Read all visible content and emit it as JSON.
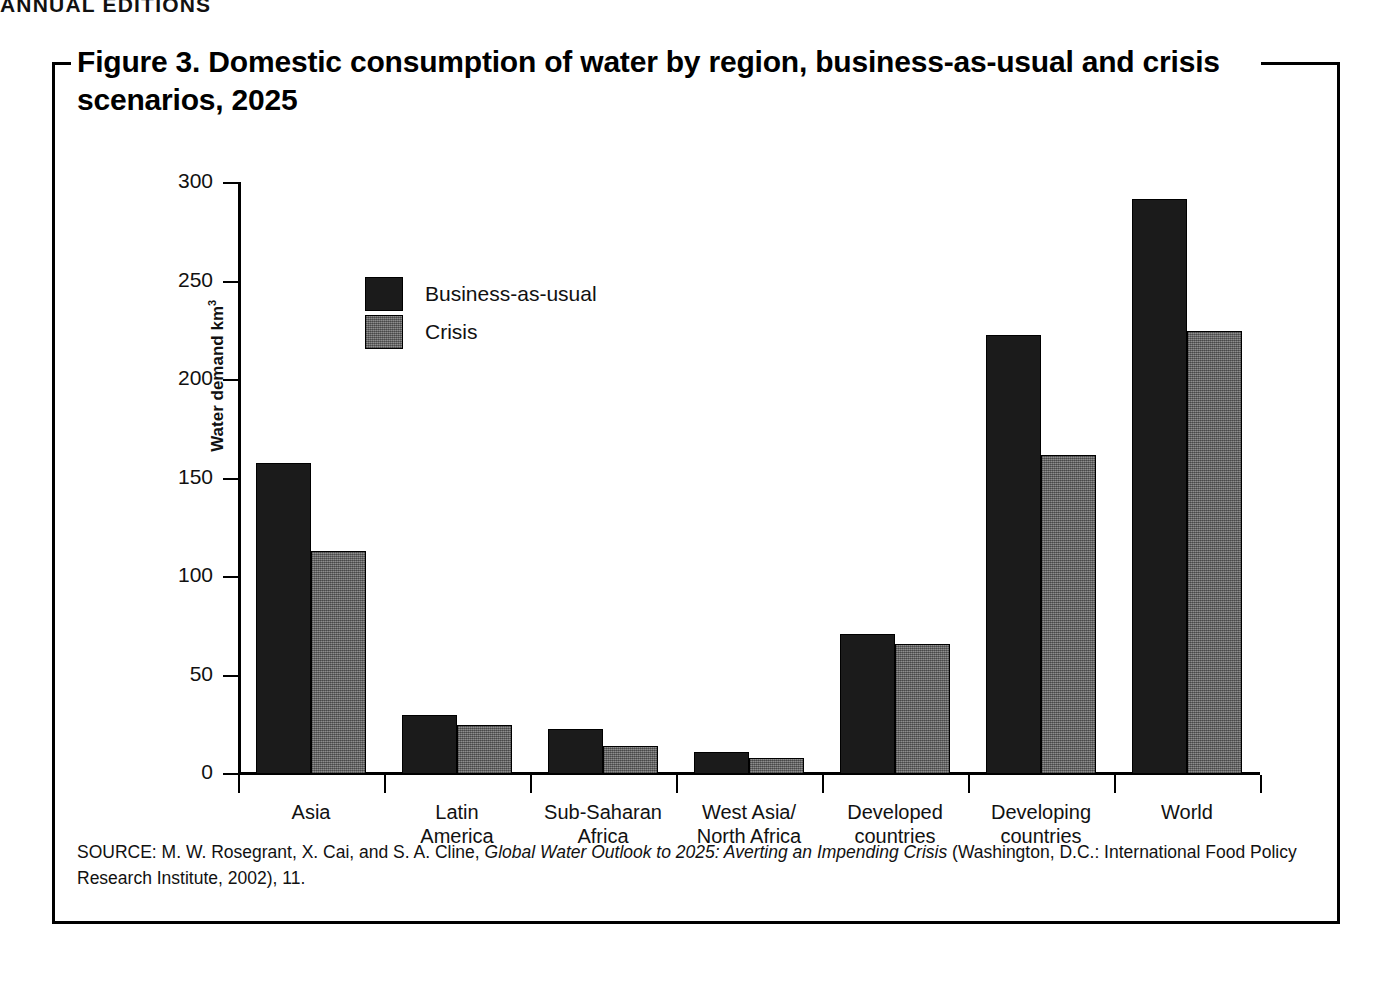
{
  "running_head": "ANNUAL EDITIONS",
  "figure": {
    "title": "Figure 3. Domestic consumption of water by region, business-as-usual and crisis scenarios, 2025",
    "source_prefix": "SOURCE: M. W. Rosegrant, X. Cai, and S. A. Cline, ",
    "source_italic": "Global Water Outlook to 2025: Averting an Impending Crisis",
    "source_suffix": " (Washington, D.C.: International Food Policy Research Institute, 2002), 11."
  },
  "colors": {
    "business_as_usual": "#1b1b1b",
    "crisis": "#767676",
    "axis": "#000000",
    "frame": "#000000",
    "background": "#ffffff"
  },
  "legend": {
    "position": "inside-upper-left",
    "items": [
      {
        "label": "Business-as-usual",
        "swatch": "business_as_usual"
      },
      {
        "label": "Crisis",
        "swatch": "crisis"
      }
    ]
  },
  "chart_data": {
    "type": "bar",
    "title": "Figure 3. Domestic consumption of water by region, business-as-usual and crisis scenarios, 2025",
    "xlabel": "",
    "ylabel": "Water demand km³",
    "ylim": [
      0,
      300
    ],
    "yticks": [
      0,
      50,
      100,
      150,
      200,
      250,
      300
    ],
    "ytick_labels": [
      "0",
      "50",
      "100",
      "150",
      "200",
      "250",
      "300"
    ],
    "grid": false,
    "legend_position": "upper left (inside plot)",
    "categories": [
      "Asia",
      "Latin America",
      "Sub-Saharan Africa",
      "West Asia/North Africa",
      "Developed countries",
      "Developing countries",
      "World"
    ],
    "category_lines": [
      [
        "Asia"
      ],
      [
        "Latin",
        "America"
      ],
      [
        "Sub-Saharan",
        "Africa"
      ],
      [
        "West Asia/",
        "North Africa"
      ],
      [
        "Developed",
        "countries"
      ],
      [
        "Developing",
        "countries"
      ],
      [
        "World"
      ]
    ],
    "series": [
      {
        "name": "Business-as-usual",
        "color": "#1b1b1b",
        "values": [
          158,
          30,
          23,
          11,
          71,
          223,
          292
        ]
      },
      {
        "name": "Crisis",
        "color": "#767676",
        "values": [
          113,
          25,
          14,
          8,
          66,
          162,
          225
        ]
      }
    ]
  }
}
